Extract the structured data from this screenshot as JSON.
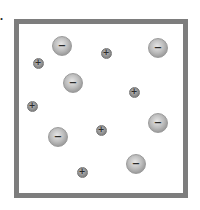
{
  "figure": {
    "panel_label": "a.",
    "border_color": "#7d7d7d",
    "anion_color": "#b0b0b0",
    "cation_color": "#8c8c8c"
  },
  "particles": [
    {
      "type": "anion",
      "sign": "−",
      "x": 62,
      "y": 46
    },
    {
      "type": "cation",
      "sign": "+",
      "x": 38,
      "y": 63
    },
    {
      "type": "cation",
      "sign": "+",
      "x": 106,
      "y": 53
    },
    {
      "type": "anion",
      "sign": "−",
      "x": 158,
      "y": 48
    },
    {
      "type": "anion",
      "sign": "−",
      "x": 73,
      "y": 83
    },
    {
      "type": "cation",
      "sign": "+",
      "x": 134,
      "y": 92
    },
    {
      "type": "cation",
      "sign": "+",
      "x": 32,
      "y": 106
    },
    {
      "type": "anion",
      "sign": "−",
      "x": 158,
      "y": 123
    },
    {
      "type": "anion",
      "sign": "−",
      "x": 58,
      "y": 137
    },
    {
      "type": "cation",
      "sign": "+",
      "x": 101,
      "y": 130
    },
    {
      "type": "anion",
      "sign": "−",
      "x": 136,
      "y": 164
    },
    {
      "type": "cation",
      "sign": "+",
      "x": 82,
      "y": 172
    }
  ]
}
